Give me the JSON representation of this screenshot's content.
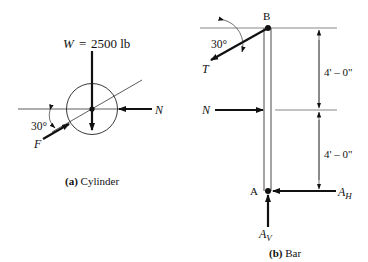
{
  "cylinder": {
    "weight_label": "W",
    "weight_eq": "=",
    "weight_value": "2500 lb",
    "normal_label": "N",
    "friction_label": "F",
    "angle_label": "30°",
    "caption_prefix": "(a)",
    "caption_text": " Cylinder"
  },
  "bar": {
    "top_point_label": "B",
    "bottom_point_label": "A",
    "tension_label": "T",
    "angle_label": "30°",
    "normal_label": "N",
    "horizontal_reaction_label": "A",
    "horizontal_reaction_sub": "H",
    "vertical_reaction_label": "A",
    "vertical_reaction_sub": "V",
    "upper_dimension": "4' – 0\"",
    "lower_dimension": "4' – 0\"",
    "caption_prefix": "(b)",
    "caption_text": " Bar"
  }
}
